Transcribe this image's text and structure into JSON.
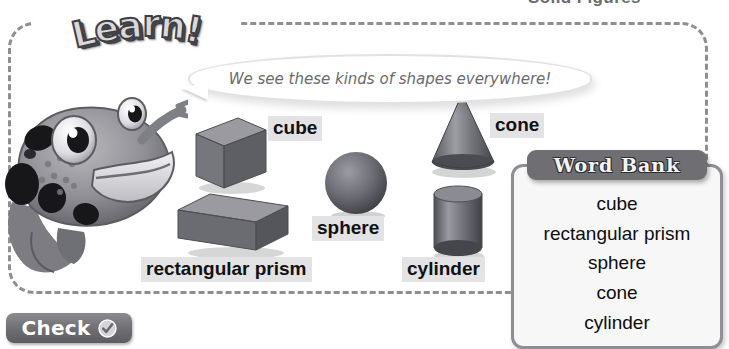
{
  "page": {
    "title": "Solid Figures"
  },
  "panel": {
    "banner_label": "Learn!",
    "speech": {
      "text": "We see these kinds of shapes everywhere!"
    },
    "mascot": {
      "icon": "fish-mascot-icon",
      "description": "spotted fish character pointing"
    },
    "shapes": [
      {
        "id": "cube",
        "label": "cube",
        "icon": "cube-3d-icon"
      },
      {
        "id": "rectangular-prism",
        "label": "rectangular prism",
        "icon": "rectangular-prism-3d-icon"
      },
      {
        "id": "sphere",
        "label": "sphere",
        "icon": "sphere-3d-icon"
      },
      {
        "id": "cone",
        "label": "cone",
        "icon": "cone-3d-icon"
      },
      {
        "id": "cylinder",
        "label": "cylinder",
        "icon": "cylinder-3d-icon"
      }
    ]
  },
  "word_bank": {
    "title": "Word Bank",
    "words": [
      "cube",
      "rectangular prism",
      "sphere",
      "cone",
      "cylinder"
    ]
  },
  "check": {
    "label": "Check",
    "icon": "check-circle-icon"
  },
  "colors": {
    "panel_border": "#8e8e93",
    "label_background": "#e3e3e5",
    "word_bank_header": "#6e6e73",
    "button_background": "#6d6d72",
    "title_text": "#6b6b70",
    "speech_text": "#6a6a70"
  }
}
